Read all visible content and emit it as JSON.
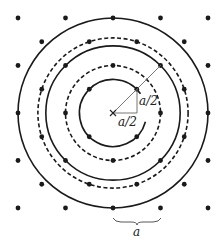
{
  "diagram": {
    "lattice_spacing_px": 47.5,
    "center": {
      "x": 113,
      "y": 113,
      "marker": "×"
    },
    "labels": {
      "horizontal_leg": "a/2",
      "vertical_leg": "a/2",
      "spacing": "a"
    },
    "circles": [
      {
        "name": "circle-1",
        "radius_factor": 0.7071,
        "style": "solid"
      },
      {
        "name": "circle-2",
        "radius_factor": 1.0,
        "style": "dashed"
      },
      {
        "name": "circle-3",
        "radius_factor": 1.4142,
        "style": "solid"
      },
      {
        "name": "circle-4",
        "radius_factor": 1.5811,
        "style": "dashed"
      },
      {
        "name": "circle-5",
        "radius_factor": 2.0,
        "style": "solid"
      }
    ],
    "colors": {
      "ink": "#1a1a1a",
      "thin": "#555555"
    }
  }
}
